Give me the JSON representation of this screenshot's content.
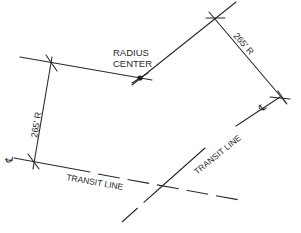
{
  "diagram": {
    "type": "engineering-drawing",
    "colors": {
      "line": "#2a2a2a",
      "background": "#ffffff"
    },
    "labels": {
      "radius_center": [
        "RADIUS",
        "CENTER"
      ],
      "left_radius": "265' R",
      "right_radius": "265' R",
      "left_transit": "TRANSIT LINE",
      "right_transit": "TRANSIT LINE",
      "centerline_symbol": "℄"
    },
    "points": {
      "radius_center": [
        140,
        78
      ],
      "left_top_cross": [
        51,
        63
      ],
      "left_bottom_cross": [
        34,
        161
      ],
      "right_top_cross": [
        215,
        18
      ],
      "right_bottom_cross": [
        281,
        97
      ],
      "transit_intersection": [
        173,
        189
      ]
    }
  }
}
